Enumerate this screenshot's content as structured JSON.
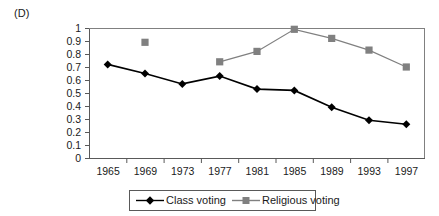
{
  "figure": {
    "panel_label": "(D)"
  },
  "chart_data": {
    "type": "line",
    "title": "",
    "subtitle": "",
    "xlabel": "",
    "ylabel": "",
    "categories": [
      "1965",
      "1969",
      "1973",
      "1977",
      "1981",
      "1985",
      "1989",
      "1993",
      "1997"
    ],
    "ylim": [
      0,
      1
    ],
    "ytick_labels": [
      "0",
      "0.1",
      "0.2",
      "0.3",
      "0.4",
      "0.5",
      "0.6",
      "0.7",
      "0.8",
      "0.9",
      "1"
    ],
    "ytick_values": [
      0,
      0.1,
      0.2,
      0.3,
      0.4,
      0.5,
      0.6,
      0.7,
      0.8,
      0.9,
      1
    ],
    "grid": false,
    "legend_position": "bottom",
    "series": [
      {
        "name": "Class voting",
        "color": "#000000",
        "marker": "diamond",
        "values": [
          0.72,
          0.65,
          0.57,
          0.63,
          0.53,
          0.52,
          0.39,
          0.29,
          0.26
        ]
      },
      {
        "name": "Religious voting",
        "color": "#808080",
        "marker": "square",
        "values": [
          null,
          0.89,
          null,
          0.74,
          0.82,
          0.99,
          0.92,
          0.83,
          0.7
        ]
      }
    ]
  }
}
